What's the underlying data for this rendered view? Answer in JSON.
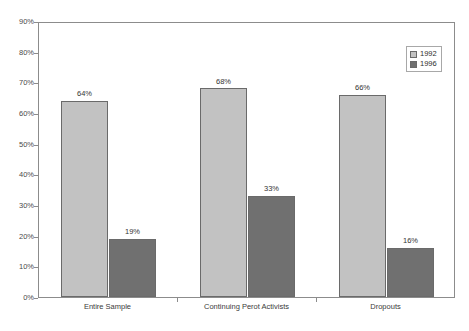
{
  "chart_data": {
    "type": "bar",
    "title": "",
    "subtitle": "",
    "xlabel": "",
    "ylabel": "",
    "categories": [
      "Entire Sample",
      "Continuing Perot Activists",
      "Dropouts"
    ],
    "series": [
      {
        "name": "1992",
        "color": "#c2c2c2",
        "values": [
          64,
          68,
          66
        ],
        "value_labels": [
          "64%",
          "68%",
          "66%"
        ]
      },
      {
        "name": "1996",
        "color": "#707070",
        "values": [
          19,
          33,
          16
        ],
        "value_labels": [
          "19%",
          "33%",
          "16%"
        ]
      }
    ],
    "ylim": [
      0,
      90
    ],
    "y_ticks": [
      0,
      10,
      20,
      30,
      40,
      50,
      60,
      70,
      80,
      90
    ],
    "y_tick_labels": [
      "0%",
      "10%",
      "20%",
      "30%",
      "40%",
      "50%",
      "60%",
      "70%",
      "80%",
      "90%"
    ],
    "grid": false,
    "legend_position": "top-right",
    "value_suffix": "%"
  },
  "legend": {
    "entries": [
      {
        "label": "1992"
      },
      {
        "label": "1996"
      }
    ]
  }
}
